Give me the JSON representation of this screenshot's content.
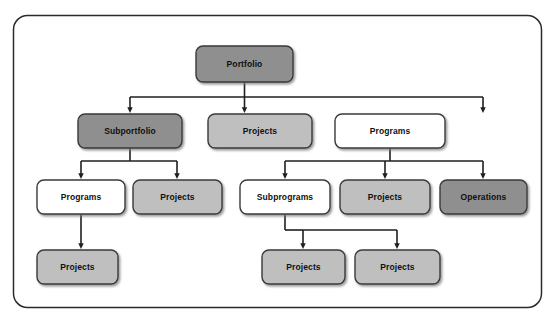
{
  "diagram": {
    "type": "organizational-tree",
    "frame": {
      "border_color": "#2b2b2b",
      "fill_color": "#ffffff",
      "corner_radius": 14
    },
    "legend_colors": {
      "dark_gray": "#8f8f8f",
      "medium_gray": "#bfbfbf",
      "white": "#ffffff",
      "border": "#3a3a3a",
      "connector": "#1f1f1f",
      "text": "#101010"
    },
    "nodes": [
      {
        "id": "portfolio",
        "label": "Portfolio",
        "level": 1,
        "style": "dark",
        "x": 196,
        "y": 46,
        "w": 97,
        "h": 36
      },
      {
        "id": "subportfolio",
        "label": "Subportfolio",
        "level": 2,
        "style": "dark",
        "x": 78,
        "y": 114,
        "w": 104,
        "h": 34
      },
      {
        "id": "projects-l2",
        "label": "Projects",
        "level": 2,
        "style": "medium",
        "x": 208,
        "y": 114,
        "w": 104,
        "h": 34
      },
      {
        "id": "programs-l2",
        "label": "Programs",
        "level": 2,
        "style": "white",
        "x": 335,
        "y": 114,
        "w": 110,
        "h": 34
      },
      {
        "id": "programs-l3",
        "label": "Programs",
        "level": 3,
        "style": "white",
        "x": 37,
        "y": 180,
        "w": 88,
        "h": 34
      },
      {
        "id": "projects-l3a",
        "label": "Projects",
        "level": 3,
        "style": "medium",
        "x": 133,
        "y": 180,
        "w": 89,
        "h": 34
      },
      {
        "id": "subprograms",
        "label": "Subprograms",
        "level": 3,
        "style": "white",
        "x": 240,
        "y": 180,
        "w": 90,
        "h": 34
      },
      {
        "id": "projects-l3b",
        "label": "Projects",
        "level": 3,
        "style": "medium",
        "x": 340,
        "y": 180,
        "w": 90,
        "h": 34
      },
      {
        "id": "operations",
        "label": "Operations",
        "level": 3,
        "style": "dark",
        "x": 440,
        "y": 180,
        "w": 87,
        "h": 34
      },
      {
        "id": "projects-l4a",
        "label": "Projects",
        "level": 4,
        "style": "medium",
        "x": 37,
        "y": 250,
        "w": 81,
        "h": 34
      },
      {
        "id": "projects-l4b",
        "label": "Projects",
        "level": 4,
        "style": "medium",
        "x": 262,
        "y": 250,
        "w": 83,
        "h": 34
      },
      {
        "id": "projects-l4c",
        "label": "Projects",
        "level": 4,
        "style": "medium",
        "x": 355,
        "y": 250,
        "w": 85,
        "h": 34
      }
    ],
    "edges": [
      {
        "from": "portfolio",
        "to": "subportfolio"
      },
      {
        "from": "portfolio",
        "to": "projects-l2"
      },
      {
        "from": "portfolio",
        "to": "programs-l2"
      },
      {
        "from": "subportfolio",
        "to": "programs-l3"
      },
      {
        "from": "subportfolio",
        "to": "projects-l3a"
      },
      {
        "from": "programs-l2",
        "to": "subprograms"
      },
      {
        "from": "programs-l2",
        "to": "projects-l3b"
      },
      {
        "from": "programs-l2",
        "to": "operations"
      },
      {
        "from": "programs-l3",
        "to": "projects-l4a"
      },
      {
        "from": "subprograms",
        "to": "projects-l4b"
      },
      {
        "from": "subprograms",
        "to": "projects-l4c"
      }
    ]
  }
}
